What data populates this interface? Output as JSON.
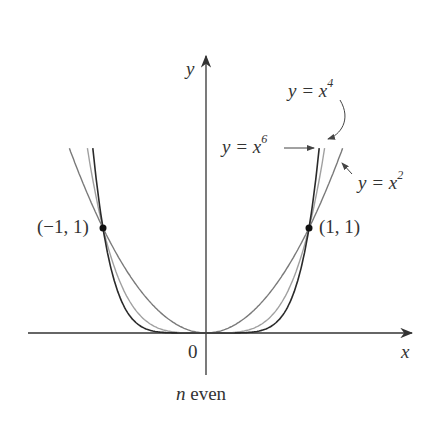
{
  "diagram": {
    "caption_var": "n",
    "caption_rest": " even",
    "axes": {
      "x_label": "x",
      "y_label": "y",
      "origin_label": "0"
    },
    "points": [
      {
        "label": "(−1, 1)",
        "x": -1,
        "y": 1
      },
      {
        "label": "(1, 1)",
        "x": 1,
        "y": 1
      }
    ],
    "curves": [
      {
        "label_pre": "y = x",
        "exp": "2",
        "n": 2,
        "color": "#7a7a7a"
      },
      {
        "label_pre": "y = x",
        "exp": "4",
        "n": 4,
        "color": "#9a9a9a"
      },
      {
        "label_pre": "y = x",
        "exp": "6",
        "n": 6,
        "color": "#2a2a2a"
      }
    ]
  }
}
